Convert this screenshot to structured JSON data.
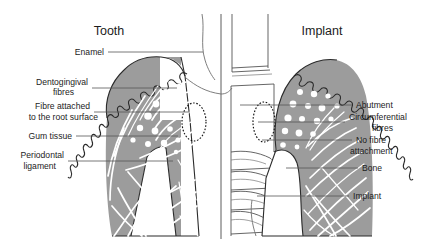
{
  "figure": {
    "kind": "dental-comparison-diagram",
    "width": 427,
    "height": 245,
    "background_color": "#ffffff"
  },
  "panels": {
    "left": {
      "title": "Tooth",
      "side": "left"
    },
    "right": {
      "title": "Implant",
      "side": "right"
    }
  },
  "labels": {
    "left": [
      {
        "id": "enamel",
        "text": "Enamel",
        "lines": [
          "Enamel"
        ]
      },
      {
        "id": "dentogingival-fibres",
        "text": "Dentogingival fibres",
        "lines": [
          "Dentogingival",
          "fibres"
        ]
      },
      {
        "id": "fibre-attached-root",
        "text": "Fibre attached to the root surface",
        "lines": [
          "Fibre attached",
          "to the root surface"
        ]
      },
      {
        "id": "gum-tissue",
        "text": "Gum tissue",
        "lines": [
          "Gum tissue"
        ]
      },
      {
        "id": "periodontal-ligament",
        "text": "Periodontal ligament",
        "lines": [
          "Periodontal",
          "ligament"
        ]
      }
    ],
    "right": [
      {
        "id": "abutment",
        "text": "Abutment",
        "lines": [
          "Abutment"
        ]
      },
      {
        "id": "circumferential-fibres",
        "text": "Circumferential fibres",
        "lines": [
          "Circumferential",
          "fibres"
        ]
      },
      {
        "id": "no-fibre-attachment",
        "text": "No fibre attachment",
        "lines": [
          "No fibre",
          "attachment"
        ]
      },
      {
        "id": "bone",
        "text": "Bone",
        "lines": [
          "Bone"
        ]
      },
      {
        "id": "implant",
        "text": "Implant",
        "lines": [
          "Implant"
        ]
      }
    ]
  },
  "label_text": {
    "left_enamel": "Enamel",
    "left_dentogingival_1": "Dentogingival",
    "left_dentogingival_2": "fibres",
    "left_fibre_attached_1": "Fibre attached",
    "left_fibre_attached_2": "to the root surface",
    "left_gum_tissue": "Gum tissue",
    "left_periodontal_1": "Periodontal",
    "left_periodontal_2": "ligament",
    "right_abutment": "Abutment",
    "right_circumferential_1": "Circumferential",
    "right_circumferential_2": "fibres",
    "right_no_fibre_1": "No fibre",
    "right_no_fibre_2": "attachment",
    "right_bone": "Bone",
    "right_implant": "Implant"
  },
  "colors": {
    "tissue_gray": "#9c9c9c",
    "outline_black": "#2b2b2b",
    "fibre_white": "#ffffff",
    "leader_gray": "#555555",
    "text_black": "#1c1c1c",
    "divider_gray": "#4a4a4a"
  }
}
